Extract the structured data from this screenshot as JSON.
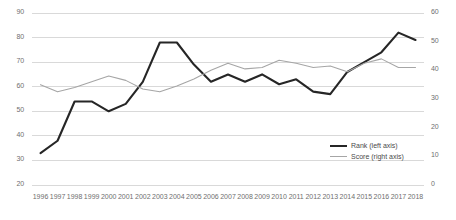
{
  "chart_data": {
    "type": "line",
    "title": "",
    "xlabel": "",
    "ylabel": "",
    "grid": true,
    "legend_position": "inside-right",
    "categories": [
      1996,
      1997,
      1998,
      1999,
      2000,
      2001,
      2002,
      2003,
      2004,
      2005,
      2006,
      2007,
      2008,
      2009,
      2010,
      2011,
      2012,
      2013,
      2014,
      2015,
      2016,
      2017,
      2018
    ],
    "axes": {
      "left": {
        "name": "Rank (left axis)",
        "min": 20,
        "max": 90,
        "step": 10,
        "ticks": [
          20,
          30,
          40,
          50,
          60,
          70,
          80,
          90
        ]
      },
      "right": {
        "name": "Score (right axis)",
        "min": 0,
        "max": 60,
        "step": 10,
        "ticks": [
          0,
          10,
          20,
          30,
          40,
          50,
          60
        ]
      }
    },
    "series": [
      {
        "name": "Rank (left axis)",
        "axis": "left",
        "color": "#262626",
        "width": 2.1,
        "values": [
          33,
          38,
          54,
          54,
          50,
          53,
          62,
          78,
          78,
          69,
          62,
          65,
          62,
          65,
          61,
          63,
          58,
          57,
          66,
          70,
          74,
          82,
          79
        ]
      },
      {
        "name": "Score (right axis)",
        "axis": "right",
        "color": "#a6a6a6",
        "width": 1.1,
        "values": [
          35,
          32.5,
          34,
          36,
          38,
          36.5,
          33.5,
          32.5,
          34.5,
          37,
          40,
          42.5,
          40.5,
          41,
          43.5,
          42.5,
          41,
          41.5,
          39.5,
          42.5,
          44,
          41,
          41
        ]
      }
    ]
  },
  "legend": {
    "items": [
      {
        "label": "Rank (left axis)",
        "key": "rank"
      },
      {
        "label": "Score (right axis)",
        "key": "score"
      }
    ]
  },
  "colors": {
    "rank_line": "#262626",
    "score_line": "#a6a6a6",
    "gridline": "#d9d9d9",
    "tick_text": "#6f6f6f",
    "plot_background": "#ffffff"
  }
}
